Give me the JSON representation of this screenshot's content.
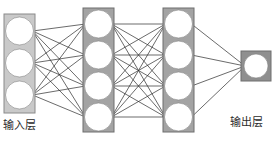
{
  "diagram": {
    "type": "neural-network",
    "title": "",
    "background_color": "#ffffff",
    "edge_color": "#2b2b2b",
    "node_fill": "#ffffff",
    "node_stroke": "#808080",
    "labels": {
      "input": "输入层",
      "output": "输出层"
    },
    "layers": [
      {
        "id": "input",
        "name": "input-layer",
        "label": "输入层",
        "node_count": 3,
        "box_color": "#c9c9c9",
        "box_border": "#8a8a8a",
        "box": {
          "x": 4,
          "y": 14,
          "w": 31,
          "h": 99
        },
        "nodes": [
          {
            "cx": 19.5,
            "cy": 31,
            "r": 14
          },
          {
            "cx": 19.5,
            "cy": 63,
            "r": 14
          },
          {
            "cx": 19.5,
            "cy": 95,
            "r": 14
          }
        ]
      },
      {
        "id": "hidden1",
        "name": "hidden-layer-1",
        "label": "",
        "node_count": 4,
        "box_color": "#a3a3a3",
        "box_border": "#6e6e6e",
        "box": {
          "x": 83,
          "y": 8,
          "w": 31,
          "h": 124
        },
        "nodes": [
          {
            "cx": 98.5,
            "cy": 24,
            "r": 14
          },
          {
            "cx": 98.5,
            "cy": 55,
            "r": 14
          },
          {
            "cx": 98.5,
            "cy": 86,
            "r": 14
          },
          {
            "cx": 98.5,
            "cy": 117,
            "r": 14
          }
        ]
      },
      {
        "id": "hidden2",
        "name": "hidden-layer-2",
        "label": "",
        "node_count": 4,
        "box_color": "#a3a3a3",
        "box_border": "#6e6e6e",
        "box": {
          "x": 163,
          "y": 8,
          "w": 31,
          "h": 124
        },
        "nodes": [
          {
            "cx": 178.5,
            "cy": 24,
            "r": 14
          },
          {
            "cx": 178.5,
            "cy": 55,
            "r": 14
          },
          {
            "cx": 178.5,
            "cy": 86,
            "r": 14
          },
          {
            "cx": 178.5,
            "cy": 117,
            "r": 14
          }
        ]
      },
      {
        "id": "output",
        "name": "output-layer",
        "label": "输出层",
        "node_count": 1,
        "box_color": "#8f8f8f",
        "box_border": "#6e6e6e",
        "box": {
          "x": 241,
          "y": 51,
          "w": 30,
          "h": 30
        },
        "nodes": [
          {
            "cx": 256,
            "cy": 66,
            "r": 12
          }
        ]
      }
    ],
    "connections": [
      {
        "from": "input",
        "to": "hidden1",
        "fully_connected": true,
        "edge_count": 12,
        "arrowheads": true
      },
      {
        "from": "hidden1",
        "to": "hidden2",
        "fully_connected": true,
        "edge_count": 16,
        "arrowheads": true
      },
      {
        "from": "hidden2",
        "to": "output",
        "fully_connected": true,
        "edge_count": 4,
        "arrowheads": true
      }
    ]
  }
}
